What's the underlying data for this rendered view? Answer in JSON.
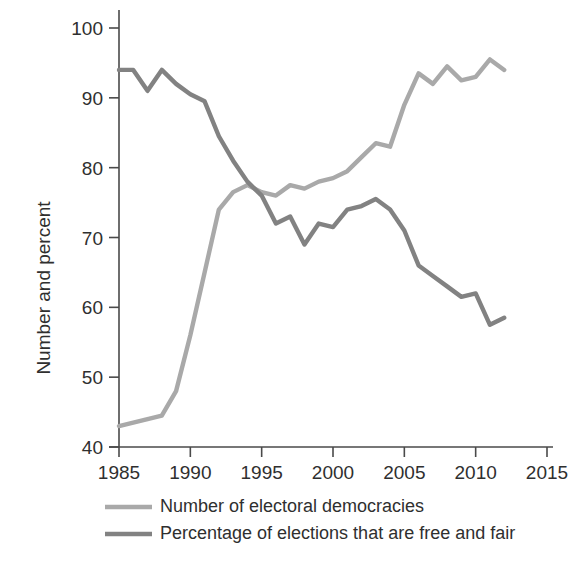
{
  "chart_data": {
    "type": "line",
    "title": "",
    "subtitle": "",
    "xlabel": "",
    "ylabel": "Number and percent",
    "xlim": [
      1985,
      2015
    ],
    "ylim": [
      40,
      100
    ],
    "xticks": [
      1985,
      1990,
      1995,
      2000,
      2005,
      2010,
      2015
    ],
    "yticks": [
      40,
      50,
      60,
      70,
      80,
      90,
      100
    ],
    "xtick_labels": [
      "1985",
      "1990",
      "1995",
      "2000",
      "2005",
      "2010",
      "2015"
    ],
    "ytick_labels": [
      "40",
      "50",
      "60",
      "70",
      "80",
      "90",
      "100"
    ],
    "grid": false,
    "legend_position": "below",
    "series": [
      {
        "name": "Number of electoral democracies",
        "color": "#a9a9a9",
        "x": [
          1985,
          1986,
          1987,
          1988,
          1989,
          1990,
          1991,
          1992,
          1993,
          1994,
          1995,
          1996,
          1997,
          1998,
          1999,
          2000,
          2001,
          2002,
          2003,
          2004,
          2005,
          2006,
          2007,
          2008,
          2009,
          2010,
          2011,
          2012
        ],
        "values": [
          43,
          43.5,
          44,
          44.5,
          48,
          56,
          65,
          74,
          76.5,
          77.5,
          76.5,
          76,
          77.5,
          77,
          78,
          78.5,
          79.5,
          81.5,
          83.5,
          83,
          89,
          93.5,
          92,
          94.5,
          92.5,
          93,
          95.5,
          94
        ]
      },
      {
        "name": "Percentage of elections that are free and fair",
        "color": "#828282",
        "x": [
          1985,
          1986,
          1987,
          1988,
          1989,
          1990,
          1991,
          1992,
          1993,
          1994,
          1995,
          1996,
          1997,
          1998,
          1999,
          2000,
          2001,
          2002,
          2003,
          2004,
          2005,
          2006,
          2007,
          2008,
          2009,
          2010,
          2011,
          2012
        ],
        "values": [
          94,
          94,
          91,
          94,
          92,
          90.5,
          89.5,
          84.5,
          81,
          78,
          76,
          72,
          73,
          69,
          72,
          71.5,
          74,
          74.5,
          75.5,
          74,
          71,
          66,
          64.5,
          63,
          61.5,
          62,
          57.5,
          58.5
        ]
      }
    ]
  },
  "legend": {
    "items": [
      {
        "label": "Number of electoral democracies",
        "color": "#a9a9a9"
      },
      {
        "label": "Percentage of elections that are free and fair",
        "color": "#828282"
      }
    ]
  },
  "axes": {
    "y_axis_title": "Number and percent"
  }
}
